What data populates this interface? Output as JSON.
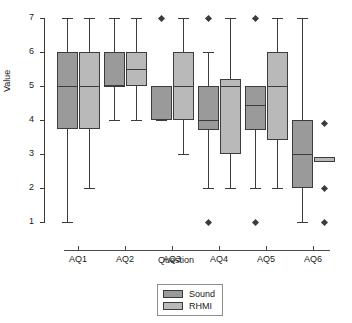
{
  "chart_data": {
    "type": "box",
    "title": "",
    "xlabel": "Question",
    "ylabel": "Value",
    "categories": [
      "AQ1",
      "AQ2",
      "AQ3",
      "AQ4",
      "AQ5",
      "AQ6"
    ],
    "ylim": [
      1,
      7
    ],
    "yticks": [
      1,
      2,
      3,
      4,
      5,
      6,
      7
    ],
    "ytick_labels": [
      "1",
      "2",
      "3",
      "4",
      "5",
      "6",
      "7"
    ],
    "grid": false,
    "legend_position": "bottom-center",
    "colors": {
      "sound": "#9a9a9a",
      "rhmi": "#b9b9b9",
      "line": "#3c3c3c",
      "axis": "#3a3a3a",
      "background": "#ffffff"
    },
    "series": [
      {
        "name": "Sound",
        "color": "#9a9a9a",
        "boxes": [
          {
            "category": "AQ1",
            "whisker_low": 1.0,
            "q1": 3.75,
            "median": 5.0,
            "q3": 6.0,
            "whisker_high": 7.0,
            "outliers": []
          },
          {
            "category": "AQ2",
            "whisker_low": 4.0,
            "q1": 5.0,
            "median": 5.0,
            "q3": 6.0,
            "whisker_high": 7.0,
            "outliers": []
          },
          {
            "category": "AQ3",
            "whisker_low": 4.0,
            "q1": 4.0,
            "median": 5.0,
            "q3": 5.0,
            "whisker_high": 5.0,
            "outliers": [
              7.0
            ]
          },
          {
            "category": "AQ4",
            "whisker_low": 2.0,
            "q1": 3.7,
            "median": 4.0,
            "q3": 5.0,
            "whisker_high": 6.0,
            "outliers": [
              7.0,
              1.0
            ]
          },
          {
            "category": "AQ5",
            "whisker_low": 2.0,
            "q1": 3.7,
            "median": 4.45,
            "q3": 5.0,
            "whisker_high": 5.0,
            "outliers": [
              7.0,
              1.0
            ]
          },
          {
            "category": "AQ6",
            "whisker_low": 1.0,
            "q1": 2.0,
            "median": 3.0,
            "q3": 4.0,
            "whisker_high": 7.0,
            "outliers": []
          }
        ]
      },
      {
        "name": "RHMI",
        "color": "#b9b9b9",
        "boxes": [
          {
            "category": "AQ1",
            "whisker_low": 2.0,
            "q1": 3.75,
            "median": 5.0,
            "q3": 6.0,
            "whisker_high": 7.0,
            "outliers": []
          },
          {
            "category": "AQ2",
            "whisker_low": 4.0,
            "q1": 5.0,
            "median": 5.5,
            "q3": 6.0,
            "whisker_high": 7.0,
            "outliers": []
          },
          {
            "category": "AQ3",
            "whisker_low": 3.0,
            "q1": 4.0,
            "median": 5.0,
            "q3": 6.0,
            "whisker_high": 7.0,
            "outliers": []
          },
          {
            "category": "AQ4",
            "whisker_low": 2.0,
            "q1": 3.0,
            "median": 5.0,
            "q3": 5.2,
            "whisker_high": 7.0,
            "outliers": []
          },
          {
            "category": "AQ5",
            "whisker_low": 2.0,
            "q1": 3.4,
            "median": 5.0,
            "q3": 6.0,
            "whisker_high": 7.0,
            "outliers": []
          },
          {
            "category": "AQ6",
            "whisker_low": 2.8,
            "q1": 2.75,
            "median": 2.8,
            "q3": 2.9,
            "whisker_high": 2.8,
            "outliers": [
              3.9,
              2.0,
              1.0
            ]
          }
        ]
      }
    ]
  },
  "legend": {
    "items": [
      {
        "label": "Sound",
        "color": "#9a9a9a"
      },
      {
        "label": "RHMI",
        "color": "#b9b9b9"
      }
    ]
  }
}
